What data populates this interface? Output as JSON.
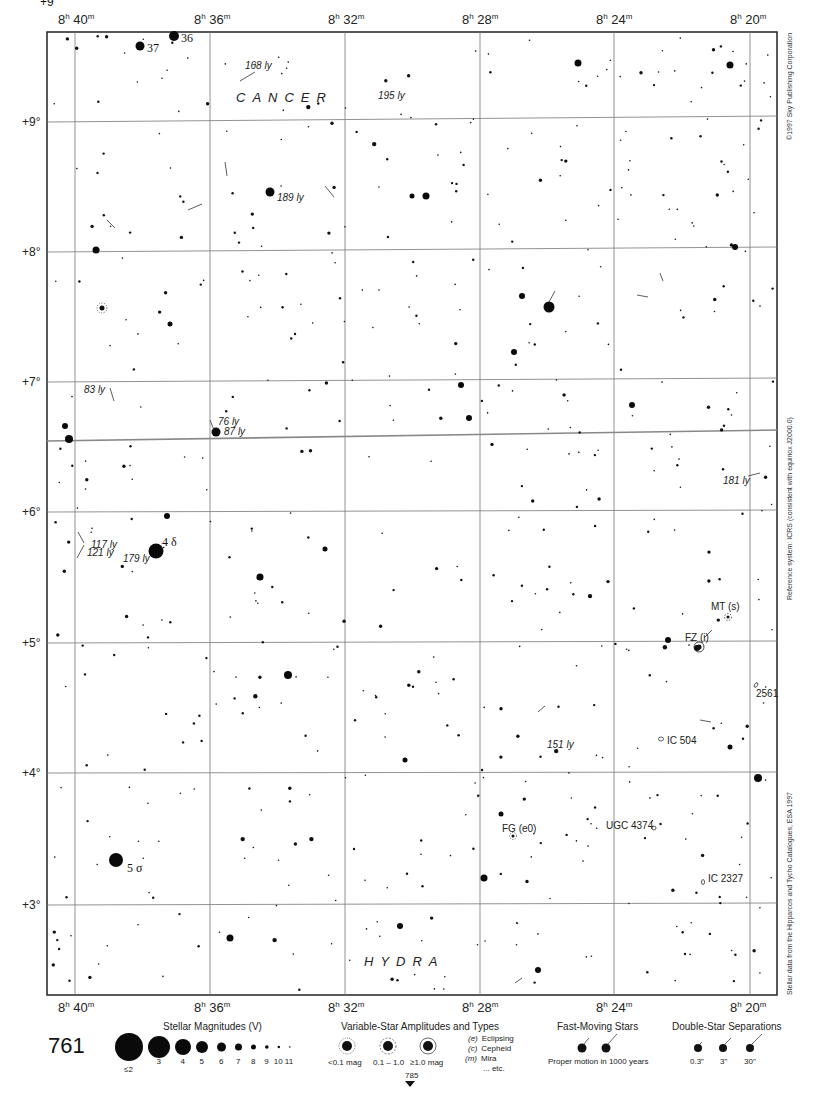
{
  "chart": {
    "page_number": "761",
    "next_page_pointer": "785",
    "frame": {
      "x0": 47,
      "y0": 32,
      "x1": 777,
      "y1": 995
    },
    "ra_labels": [
      {
        "h": "8",
        "m": "40",
        "x": 75
      },
      {
        "h": "8",
        "m": "36",
        "x": 210
      },
      {
        "h": "8",
        "m": "32",
        "x": 345
      },
      {
        "h": "8",
        "m": "28",
        "x": 480
      },
      {
        "h": "8",
        "m": "24",
        "x": 614
      },
      {
        "h": "8",
        "m": "20",
        "x": 750
      }
    ],
    "dec_labels": [
      {
        "label": "+9°",
        "yl": 122,
        "yr": 116
      },
      {
        "label": "+8°",
        "yl": 252,
        "yr": 247
      },
      {
        "label": "+7°",
        "yl": 382,
        "yr": 378
      },
      {
        "label": "+6°",
        "yl": 512,
        "yr": 510
      },
      {
        "label": "+5°",
        "yl": 643,
        "yr": 641
      },
      {
        "label": "+4°",
        "yl": 773,
        "yr": 772
      },
      {
        "label": "+3°",
        "yl": 905,
        "yr": 903
      }
    ],
    "boundary_line": {
      "yl": 441,
      "yr": 430
    },
    "constellations": [
      {
        "name": "CANCER",
        "x": 236,
        "y": 102
      },
      {
        "name": "HYDRA",
        "x": 364,
        "y": 966
      }
    ],
    "distance_labels": [
      {
        "text": "168 ly",
        "x": 245,
        "y": 69
      },
      {
        "text": "195 ly",
        "x": 378,
        "y": 99
      },
      {
        "text": "189 ly",
        "x": 277,
        "y": 201
      },
      {
        "text": "83 ly",
        "x": 84,
        "y": 393
      },
      {
        "text": "76 ly",
        "x": 218,
        "y": 425
      },
      {
        "text": "87 ly",
        "x": 224,
        "y": 435
      },
      {
        "text": "117 ly",
        "x": 91,
        "y": 548
      },
      {
        "text": "121 ly",
        "x": 87,
        "y": 556
      },
      {
        "text": "179 ly",
        "x": 123,
        "y": 562
      },
      {
        "text": "181 ly",
        "x": 723,
        "y": 484
      },
      {
        "text": "151 ly",
        "x": 547,
        "y": 748
      }
    ],
    "named_stars": [
      {
        "label": "36",
        "x": 181,
        "y": 42
      },
      {
        "label": "37",
        "x": 147,
        "y": 52
      },
      {
        "label": "4 δ",
        "x": 162,
        "y": 546
      },
      {
        "label": "5 σ",
        "x": 127,
        "y": 872
      }
    ],
    "objects": [
      {
        "label": "MT (s)",
        "x": 711,
        "y": 610,
        "type": "variable"
      },
      {
        "label": "FZ (i)",
        "x": 685,
        "y": 641,
        "type": "variable"
      },
      {
        "label": "2561",
        "x": 756,
        "y": 697,
        "type": "galaxy"
      },
      {
        "label": "IC 504",
        "x": 667,
        "y": 744,
        "type": "galaxy"
      },
      {
        "label": "FG (e0)",
        "x": 502,
        "y": 832,
        "type": "variable"
      },
      {
        "label": "UGC 4374",
        "x": 606,
        "y": 829,
        "type": "galaxy"
      },
      {
        "label": "IC 2327",
        "x": 708,
        "y": 882,
        "type": "galaxy"
      }
    ],
    "side_notes": {
      "copyright": "©1997 Sky Publishing Corporation",
      "reference": "Reference system: ICRS (consistent with equinox J2000.0)",
      "source": "Stellar data from the Hipparcos and Tycho Catalogues, ESA 1997"
    },
    "bright_stars": [
      {
        "x": 174,
        "y": 36,
        "r": 5
      },
      {
        "x": 140,
        "y": 46,
        "r": 4.5
      },
      {
        "x": 270,
        "y": 192,
        "r": 4.5
      },
      {
        "x": 549,
        "y": 307,
        "r": 5.5
      },
      {
        "x": 156,
        "y": 551,
        "r": 7.5
      },
      {
        "x": 116,
        "y": 860,
        "r": 7
      },
      {
        "x": 216,
        "y": 432,
        "r": 4.5
      },
      {
        "x": 69,
        "y": 439,
        "r": 4
      },
      {
        "x": 96,
        "y": 250,
        "r": 3.5
      },
      {
        "x": 426,
        "y": 196,
        "r": 3.5
      },
      {
        "x": 578,
        "y": 63,
        "r": 3.5
      },
      {
        "x": 730,
        "y": 65,
        "r": 3.5
      },
      {
        "x": 288,
        "y": 675,
        "r": 4
      },
      {
        "x": 260,
        "y": 577,
        "r": 3.5
      },
      {
        "x": 230,
        "y": 938,
        "r": 3.5
      },
      {
        "x": 758,
        "y": 778,
        "r": 4
      },
      {
        "x": 522,
        "y": 296,
        "r": 3
      },
      {
        "x": 514,
        "y": 352,
        "r": 3
      },
      {
        "x": 469,
        "y": 418,
        "r": 3
      },
      {
        "x": 461,
        "y": 385,
        "r": 3
      },
      {
        "x": 484,
        "y": 878,
        "r": 3.5
      },
      {
        "x": 668,
        "y": 640,
        "r": 3
      },
      {
        "x": 735,
        "y": 247,
        "r": 3
      },
      {
        "x": 632,
        "y": 405,
        "r": 3
      },
      {
        "x": 400,
        "y": 926,
        "r": 3
      },
      {
        "x": 538,
        "y": 970,
        "r": 3
      },
      {
        "x": 412,
        "y": 196,
        "r": 2.5
      },
      {
        "x": 167,
        "y": 516,
        "r": 3
      },
      {
        "x": 65,
        "y": 426,
        "r": 3
      },
      {
        "x": 170,
        "y": 324,
        "r": 2.5
      },
      {
        "x": 325,
        "y": 549,
        "r": 2.5
      },
      {
        "x": 405,
        "y": 760,
        "r": 2.5
      },
      {
        "x": 730,
        "y": 747,
        "r": 2.5
      },
      {
        "x": 697,
        "y": 648,
        "r": 3
      },
      {
        "x": 501,
        "y": 814,
        "r": 2.5
      }
    ]
  },
  "legend": {
    "magnitudes": {
      "title": "Stellar Magnitudes (V)",
      "items": [
        {
          "label": "≤2",
          "r": 14
        },
        {
          "label": "3",
          "r": 11
        },
        {
          "label": "4",
          "r": 8
        },
        {
          "label": "5",
          "r": 6
        },
        {
          "label": "6",
          "r": 4.5
        },
        {
          "label": "7",
          "r": 3.5
        },
        {
          "label": "8",
          "r": 2.5
        },
        {
          "label": "9",
          "r": 1.8
        },
        {
          "label": "10",
          "r": 1.2
        },
        {
          "label": "11",
          "r": 0.8
        }
      ]
    },
    "variables": {
      "title": "Variable-Star Amplitudes and Types",
      "amplitudes": [
        "<0.1 mag",
        "0.1 – 1.0",
        "≥1.0 mag"
      ],
      "types": [
        {
          "code": "(e)",
          "name": "Eclipsing"
        },
        {
          "code": "(c)",
          "name": "Cepheid"
        },
        {
          "code": "(m)",
          "name": "Mira"
        },
        {
          "code": "",
          "name": "... etc."
        }
      ]
    },
    "fast_moving": {
      "title": "Fast-Moving Stars",
      "caption": "Proper motion in 1000 years"
    },
    "double_stars": {
      "title": "Double-Star Separations",
      "items": [
        "0.3\"",
        "3\"",
        "30\""
      ]
    }
  }
}
